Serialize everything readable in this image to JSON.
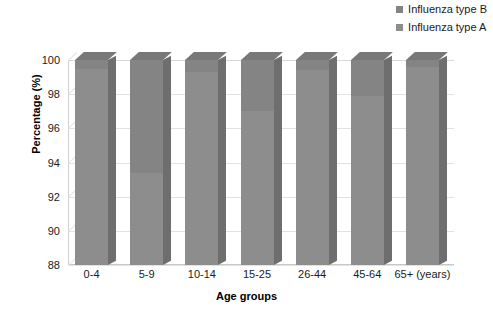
{
  "chart_data": {
    "type": "bar",
    "title": "",
    "subtitle": "",
    "xlabel": "Age groups",
    "ylabel": "Percentage (%)",
    "categories": [
      "0-4",
      "5-9",
      "10-14",
      "15-25",
      "26-44",
      "45-64",
      "65+  (years)"
    ],
    "ylim": [
      88,
      100
    ],
    "yticks": [
      88,
      90,
      92,
      94,
      96,
      98,
      100
    ],
    "ytick_labels": [
      "88",
      "90",
      "92",
      "94",
      "96",
      "98",
      "100"
    ],
    "grid": true,
    "legend_position": "top-right",
    "style": "3d-stacked-column",
    "stacked": true,
    "series": [
      {
        "name": "Influenza type A",
        "color": "#8d8d8d",
        "values": [
          99.5,
          93.4,
          99.3,
          97.0,
          99.4,
          97.9,
          99.6
        ]
      },
      {
        "name": "Influenza type B",
        "color": "#848484",
        "values": [
          0.5,
          6.6,
          0.7,
          3.0,
          0.6,
          2.1,
          0.4
        ]
      }
    ],
    "annotations": []
  },
  "legend": {
    "items": [
      {
        "label": "Influenza type B",
        "color": "#848484",
        "swatch": "square-swatch"
      },
      {
        "label": "Influenza type A",
        "color": "#8d8d8d",
        "swatch": "square-swatch"
      }
    ]
  },
  "axes": {
    "y_title": "Percentage (%)",
    "x_title": "Age groups"
  },
  "colors": {
    "bar_front_a": "#8d8d8d",
    "bar_front_b": "#848484",
    "bar_side": "#6e6e6e",
    "bar_top": "#787878",
    "gridline": "#e2e2e2",
    "background": "#ffffff",
    "text": "#1a1a1a"
  }
}
